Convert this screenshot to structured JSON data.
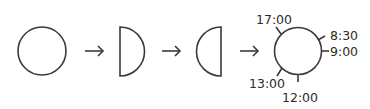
{
  "diagram": {
    "stroke_color": "#3a3a3a",
    "stages": [
      {
        "name": "full-circle"
      },
      {
        "name": "right-half-circle"
      },
      {
        "name": "left-half-circle"
      },
      {
        "name": "clock-circle"
      }
    ],
    "arrows": [
      "→",
      "→",
      "→"
    ],
    "clock_labels": {
      "t1700": "17:00",
      "t0830": "8:30",
      "t0900": "9:00",
      "t1300": "13:00",
      "t1200": "12:00"
    }
  }
}
